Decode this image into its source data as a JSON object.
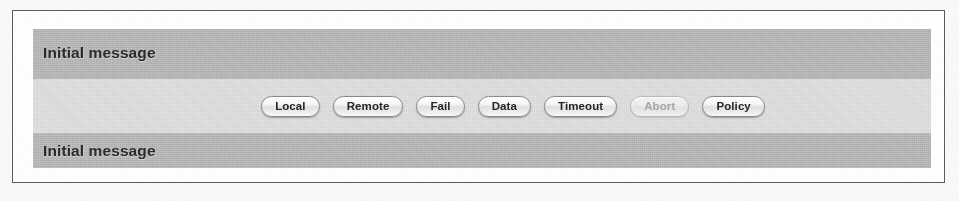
{
  "figure": {
    "frame_border_color": "#5c5c5c",
    "page_background": "#fbfbfb"
  },
  "window": {
    "background_color": "#b9b9b9",
    "bands": [
      {
        "id": "top",
        "tone": "dark",
        "color": "#b5b5b5",
        "message": "Initial message"
      },
      {
        "id": "middle",
        "tone": "light",
        "color": "#dcdcdc",
        "message": ""
      },
      {
        "id": "bottom",
        "tone": "dark",
        "color": "#b5b5b5",
        "message": "Initial message"
      }
    ]
  },
  "buttons": [
    {
      "label": "Local",
      "name": "local-button",
      "disabled": false
    },
    {
      "label": "Remote",
      "name": "remote-button",
      "disabled": false
    },
    {
      "label": "Fail",
      "name": "fail-button",
      "disabled": false
    },
    {
      "label": "Data",
      "name": "data-button",
      "disabled": false
    },
    {
      "label": "Timeout",
      "name": "timeout-button",
      "disabled": false
    },
    {
      "label": "Abort",
      "name": "abort-button",
      "disabled": true
    },
    {
      "label": "Policy",
      "name": "policy-button",
      "disabled": false
    }
  ]
}
